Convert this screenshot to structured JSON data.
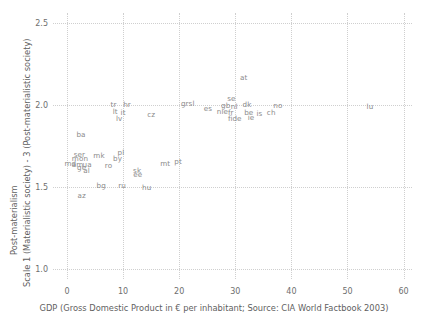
{
  "chart_data": {
    "type": "scatter",
    "title": "",
    "subtitle": "",
    "xlabel": "GDP (Gross Domestic Product in € per inhabitant; Source: CIA World Factbook 2003)",
    "ylabel_outer": "Post-materialism",
    "ylabel_inner": "Scale 1 (Materialistic society) - 3 (Post-materialistic society)",
    "xlim": [
      -2.5,
      61.5
    ],
    "ylim": [
      0.94,
      2.56
    ],
    "xticks": [
      "0",
      "10",
      "20",
      "30",
      "40",
      "50",
      "60"
    ],
    "xtick_values": [
      0,
      10,
      20,
      30,
      40,
      50,
      60
    ],
    "yticks": [
      "1.0",
      "1.5",
      "2.0",
      "2.5"
    ],
    "ytick_values": [
      1.0,
      1.5,
      2.0,
      2.5
    ],
    "grid": "dotted gridlines on both axes at major ticks",
    "legend": "none",
    "marker_style": "country code text labels only (no plotted marker symbols)",
    "points": [
      {
        "label": "ser",
        "x": 2.2,
        "y": 1.695
      },
      {
        "label": "mon",
        "x": 2.3,
        "y": 1.668
      },
      {
        "label": "md",
        "x": 0.6,
        "y": 1.64
      },
      {
        "label": "am",
        "x": 1.9,
        "y": 1.637
      },
      {
        "label": "ge",
        "x": 2.6,
        "y": 1.617
      },
      {
        "label": "ua",
        "x": 3.6,
        "y": 1.635
      },
      {
        "label": "al",
        "x": 3.5,
        "y": 1.596
      },
      {
        "label": "ba",
        "x": 2.5,
        "y": 1.818
      },
      {
        "label": "az",
        "x": 2.6,
        "y": 1.444
      },
      {
        "label": "mk",
        "x": 5.7,
        "y": 1.692
      },
      {
        "label": "bg",
        "x": 6.1,
        "y": 1.508
      },
      {
        "label": "ro",
        "x": 7.4,
        "y": 1.63
      },
      {
        "label": "by",
        "x": 9.0,
        "y": 1.668
      },
      {
        "label": "pl",
        "x": 9.6,
        "y": 1.71
      },
      {
        "label": "ru",
        "x": 9.8,
        "y": 1.505
      },
      {
        "label": "lt",
        "x": 8.6,
        "y": 1.955
      },
      {
        "label": "lv",
        "x": 9.3,
        "y": 1.912
      },
      {
        "label": "it",
        "x": 10.0,
        "y": 1.95
      },
      {
        "label": "tr",
        "x": 8.3,
        "y": 2.0
      },
      {
        "label": "hr",
        "x": 10.7,
        "y": 2.002
      },
      {
        "label": "sk",
        "x": 12.5,
        "y": 1.6
      },
      {
        "label": "ee",
        "x": 12.6,
        "y": 1.572
      },
      {
        "label": "hu",
        "x": 14.2,
        "y": 1.497
      },
      {
        "label": "cz",
        "x": 15.0,
        "y": 1.94
      },
      {
        "label": "mt",
        "x": 17.5,
        "y": 1.64
      },
      {
        "label": "pt",
        "x": 19.8,
        "y": 1.65
      },
      {
        "label": "gr",
        "x": 21.0,
        "y": 2.003
      },
      {
        "label": "sl",
        "x": 22.2,
        "y": 2.005
      },
      {
        "label": "es",
        "x": 25.1,
        "y": 1.975
      },
      {
        "label": "nie",
        "x": 27.7,
        "y": 1.955
      },
      {
        "label": "gb",
        "x": 28.3,
        "y": 1.996
      },
      {
        "label": "se",
        "x": 29.3,
        "y": 2.035
      },
      {
        "label": "fr",
        "x": 29.2,
        "y": 1.95
      },
      {
        "label": "nl",
        "x": 29.8,
        "y": 1.985
      },
      {
        "label": "fi",
        "x": 29.1,
        "y": 1.917
      },
      {
        "label": "de",
        "x": 30.3,
        "y": 1.913
      },
      {
        "label": "at",
        "x": 31.5,
        "y": 2.165
      },
      {
        "label": "dk",
        "x": 32.1,
        "y": 2.0
      },
      {
        "label": "be",
        "x": 32.4,
        "y": 1.952
      },
      {
        "label": "ie",
        "x": 32.8,
        "y": 1.918
      },
      {
        "label": "is",
        "x": 34.3,
        "y": 1.945
      },
      {
        "label": "ch",
        "x": 36.4,
        "y": 1.952
      },
      {
        "label": "no",
        "x": 37.6,
        "y": 1.995
      },
      {
        "label": "lu",
        "x": 54.0,
        "y": 1.985
      }
    ]
  },
  "colors": {
    "background": "#ffffff",
    "grid": "#cfcfcf",
    "point_label": "#8a8a8a",
    "axis_text": "#6e6e6e",
    "axis_title": "#5f5f5f"
  }
}
